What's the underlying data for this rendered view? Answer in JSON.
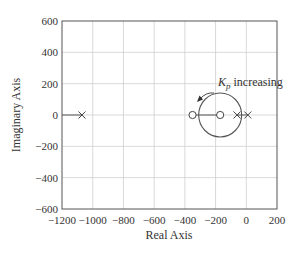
{
  "chart_data": {
    "type": "scatter",
    "title": "",
    "xlabel": "Real Axis",
    "ylabel": "Imaginary Axis",
    "xlim": [
      -1200,
      200
    ],
    "ylim": [
      -600,
      600
    ],
    "grid": true,
    "x_ticks": [
      -1200,
      -1000,
      -800,
      -600,
      -400,
      -200,
      0,
      200
    ],
    "x_tick_labels": [
      "−1200",
      "−1000",
      "−800",
      "−600",
      "−400",
      "−200",
      "0",
      "200"
    ],
    "y_ticks": [
      600,
      400,
      200,
      0,
      -200,
      -400,
      -600
    ],
    "y_tick_labels": [
      "600",
      "400",
      "200",
      "0",
      "−200",
      "−400",
      "−600"
    ],
    "poles": [
      {
        "re": -1070,
        "im": 0
      },
      {
        "re": -60,
        "im": 0
      },
      {
        "re": 10,
        "im": 0
      }
    ],
    "zeros": [
      {
        "re": -350,
        "im": 0
      },
      {
        "re": -170,
        "im": 0
      }
    ],
    "locus_segments": [
      {
        "from": -1200,
        "to": -1070,
        "im": 0
      },
      {
        "from": -350,
        "to": -170,
        "im": 0
      },
      {
        "from": -60,
        "to": 10,
        "im": 0
      }
    ],
    "locus_circle": {
      "center_re": -170,
      "center_im": 0,
      "radius": 140
    },
    "annotations": [
      {
        "text_main": "K",
        "text_sub": "p",
        "text_rest": " increasing",
        "arrow": "counter-clockwise along circle toward left"
      }
    ]
  }
}
